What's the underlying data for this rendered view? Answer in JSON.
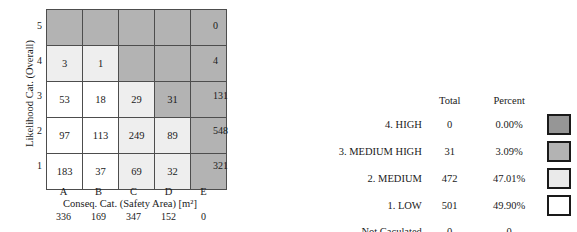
{
  "chart_data": {
    "type": "heatmap",
    "title": "",
    "xlabel": "Conseq. Cat. (Safety Area) [m²]",
    "ylabel": "Likelihood Cat. (Overall)",
    "x_categories": [
      "A",
      "B",
      "C",
      "D",
      "E"
    ],
    "y_categories": [
      "5",
      "4",
      "3",
      "2",
      "1"
    ],
    "rows": [
      {
        "label": "5",
        "cells": [
          {
            "value": "",
            "tier": "high"
          },
          {
            "value": "",
            "tier": "high"
          },
          {
            "value": "",
            "tier": "high"
          },
          {
            "value": "",
            "tier": "high"
          },
          {
            "value": "",
            "tier": "high"
          }
        ],
        "total": "0"
      },
      {
        "label": "4",
        "cells": [
          {
            "value": "3",
            "tier": "med"
          },
          {
            "value": "1",
            "tier": "med"
          },
          {
            "value": "",
            "tier": "high"
          },
          {
            "value": "",
            "tier": "high"
          },
          {
            "value": "",
            "tier": "high"
          }
        ],
        "total": "4"
      },
      {
        "label": "3",
        "cells": [
          {
            "value": "53",
            "tier": "low"
          },
          {
            "value": "18",
            "tier": "low"
          },
          {
            "value": "29",
            "tier": "med"
          },
          {
            "value": "31",
            "tier": "medhi"
          },
          {
            "value": "",
            "tier": "high"
          }
        ],
        "total": "131"
      },
      {
        "label": "2",
        "cells": [
          {
            "value": "97",
            "tier": "low"
          },
          {
            "value": "113",
            "tier": "low"
          },
          {
            "value": "249",
            "tier": "med"
          },
          {
            "value": "89",
            "tier": "med"
          },
          {
            "value": "",
            "tier": "high"
          }
        ],
        "total": "548"
      },
      {
        "label": "1",
        "cells": [
          {
            "value": "183",
            "tier": "low"
          },
          {
            "value": "37",
            "tier": "low"
          },
          {
            "value": "69",
            "tier": "med"
          },
          {
            "value": "32",
            "tier": "med"
          },
          {
            "value": "",
            "tier": "high"
          }
        ],
        "total": "321"
      }
    ],
    "column_totals": [
      "336",
      "169",
      "347",
      "152",
      "0"
    ],
    "row_totals": [
      "0",
      "4",
      "131",
      "548",
      "321"
    ],
    "colors": {
      "high": "#b3b3b3",
      "medium_high": "#b3b3b3",
      "medium": "#eeeeee",
      "low": "#ffffff",
      "grid_line": "#4d4d4d",
      "legend_high": "#969696",
      "legend_medium_high": "#b3b3b3",
      "legend_medium": "#eaeaea",
      "legend_low": "#ffffff"
    }
  },
  "matrix": {
    "y_axis_title": "Likelihood Cat. (Overall)",
    "x_axis_title": "Conseq. Cat. (Safety Area) [m²]"
  },
  "legend": {
    "headers": {
      "label": "",
      "total": "Total",
      "percent": "Percent"
    },
    "rows": [
      {
        "label": "4. HIGH",
        "total": "0",
        "percent": "0.00%",
        "swatch": "sw-high",
        "has_swatch": true
      },
      {
        "label": "3. MEDIUM HIGH",
        "total": "31",
        "percent": "3.09%",
        "swatch": "sw-medhi",
        "has_swatch": true
      },
      {
        "label": "2. MEDIUM",
        "total": "472",
        "percent": "47.01%",
        "swatch": "sw-med",
        "has_swatch": true
      },
      {
        "label": "1. LOW",
        "total": "501",
        "percent": "49.90%",
        "swatch": "sw-low",
        "has_swatch": true
      },
      {
        "label": "Not Caculated",
        "total": "0",
        "percent": "0",
        "swatch": "",
        "has_swatch": false
      }
    ]
  }
}
